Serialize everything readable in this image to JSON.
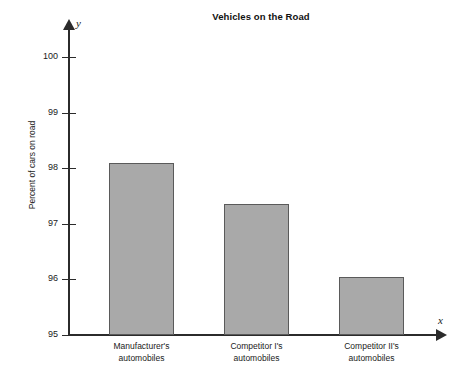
{
  "chart_data": {
    "type": "bar",
    "title": "Vehicles on the Road",
    "xlabel": "",
    "ylabel": "Percent of cars on road",
    "categories": [
      "Manufacturer's automobiles",
      "Competitor I's automobiles",
      "Competitor II's automobiles"
    ],
    "category_lines": [
      [
        "Manufacturer's",
        "automobiles"
      ],
      [
        "Competitor I's",
        "automobiles"
      ],
      [
        "Competitor II's",
        "automobiles"
      ]
    ],
    "values": [
      98.1,
      97.35,
      96.05
    ],
    "ylim": [
      95,
      100.4
    ],
    "yticks": [
      95,
      96,
      97,
      98,
      99,
      100
    ],
    "ytick_labels": [
      "95",
      "96",
      "97",
      "98",
      "99",
      "100"
    ],
    "grid": false,
    "legend": null,
    "axis_names": {
      "x": "x",
      "y": "y"
    },
    "colors": {
      "bar_fill": "#a9a9a9",
      "bar_stroke": "#5a5a5a",
      "axis": "#2b2b2b",
      "text": "#1a1a1a",
      "background": "#ffffff"
    }
  }
}
